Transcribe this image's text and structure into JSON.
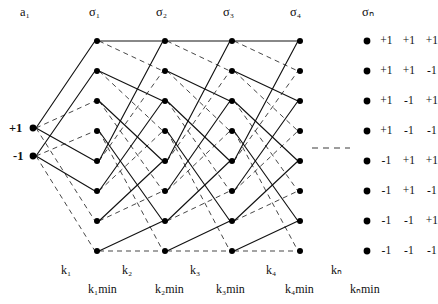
{
  "figure": {
    "type": "trellis-diagram",
    "input_label": "a₁",
    "source_states": [
      "+1",
      "-1"
    ],
    "stage_headers": [
      "σ₁",
      "σ₂",
      "σ₃",
      "σ₄",
      "σₙ"
    ],
    "bottom_labels": [
      "k₁",
      "k₂",
      "k₃",
      "k₄",
      "kₙ"
    ],
    "bottom_min_labels": [
      "k₁min",
      "k₂min",
      "k₃min",
      "k₄min",
      "kₙmin"
    ],
    "state_table": [
      [
        "+1",
        "+1",
        "+1"
      ],
      [
        "+1",
        "+1",
        "-1"
      ],
      [
        "+1",
        "-1",
        "+1"
      ],
      [
        "+1",
        "-1",
        "-1"
      ],
      [
        "-1",
        "+1",
        "+1"
      ],
      [
        "-1",
        "+1",
        "-1"
      ],
      [
        "-1",
        "-1",
        "+1"
      ],
      [
        "-1",
        "-1",
        "-1"
      ]
    ],
    "colors": {
      "ink": "#111111",
      "solid_edge": "#1a1a1a",
      "dashed_edge": "#4a4a4a",
      "node_fill": "#000000",
      "background": "#ffffff"
    },
    "geometry": {
      "state_count": 8,
      "stage_x": [
        97,
        165,
        232,
        300
      ],
      "row_y": [
        41,
        71,
        101,
        131,
        161,
        191,
        221,
        251
      ],
      "source_x": 33,
      "source_y": [
        128,
        156
      ],
      "node_radius": 3.0,
      "ellipsis_dash_segment": {
        "x1": 312,
        "x2": 350,
        "y": 148
      }
    },
    "legend_dot_x": 367
  }
}
